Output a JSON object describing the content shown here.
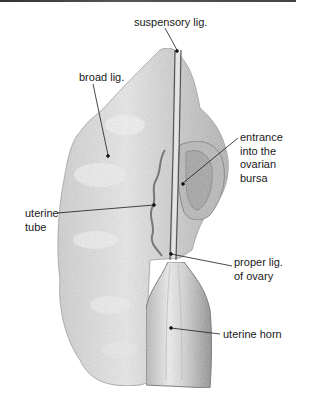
{
  "figure": {
    "type": "anatomical illustration"
  },
  "labels": {
    "suspensory": {
      "text": "suspensory lig.",
      "x": 134,
      "y": 16
    },
    "broad": {
      "text": "broad lig.",
      "x": 79,
      "y": 71
    },
    "entrance": {
      "lines": [
        "entrance",
        "into the",
        "ovarian",
        "bursa"
      ],
      "x": 240,
      "y": 131
    },
    "uterine_tube": {
      "lines": [
        "uterine",
        "tube"
      ],
      "x": 25,
      "y": 207
    },
    "proper_lig": {
      "lines": [
        "proper lig.",
        "of ovary"
      ],
      "x": 234,
      "y": 256
    },
    "uterine_horn": {
      "text": "uterine horn",
      "x": 223,
      "y": 328
    }
  },
  "colors": {
    "border": "#444444",
    "ink": "#1a1a1a",
    "shading_light": "#e6e6e6",
    "shading_mid": "#c8c8c8",
    "shading_dark": "#9a9a9a"
  }
}
